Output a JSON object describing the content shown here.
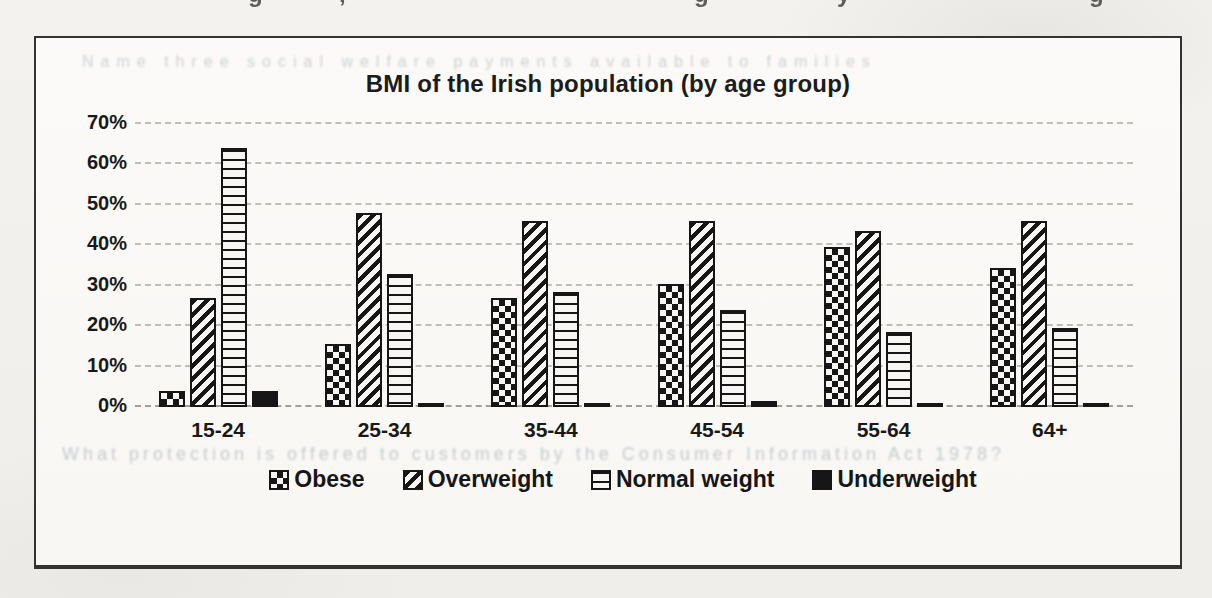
{
  "page": {
    "top_edge_glyphs": [
      {
        "char": "g",
        "x": 248
      },
      {
        "char": ",",
        "x": 339
      },
      {
        "char": "g",
        "x": 694
      },
      {
        "char": "y",
        "x": 837
      },
      {
        "char": "g",
        "x": 1089
      }
    ],
    "bleed_through_text": {
      "above_title": "Name three social welfare payments available to families",
      "below_axis": "What protection is offered to customers by the Consumer Information Act 1978?"
    }
  },
  "chart_data": {
    "type": "bar",
    "title": "BMI of the Irish population (by age group)",
    "categories": [
      "15-24",
      "25-34",
      "35-44",
      "45-54",
      "55-64",
      "64+"
    ],
    "series": [
      {
        "name": "Obese",
        "pattern": "checker",
        "values": [
          4,
          15.5,
          27,
          30.5,
          39.5,
          34.5
        ]
      },
      {
        "name": "Overweight",
        "pattern": "diagonal-stripe",
        "values": [
          27,
          48,
          46,
          46,
          43.5,
          46
        ]
      },
      {
        "name": "Normal weight",
        "pattern": "horizontal-stripe",
        "values": [
          64,
          33,
          28.5,
          24,
          18.5,
          19.5
        ]
      },
      {
        "name": "Underweight",
        "pattern": "solid",
        "values": [
          4,
          1,
          1,
          1.5,
          0.5,
          0.5
        ]
      }
    ],
    "xlabel": "",
    "ylabel": "",
    "ylim": [
      0,
      70
    ],
    "ytick_step": 10,
    "ytick_labels": [
      "0%",
      "10%",
      "20%",
      "30%",
      "40%",
      "50%",
      "60%",
      "70%"
    ],
    "grid": "horizontal-dashed",
    "legend_position": "bottom",
    "colors": {
      "ink": "#161616",
      "paper": "#f2f1ee",
      "grid": "#a8a49c"
    }
  }
}
